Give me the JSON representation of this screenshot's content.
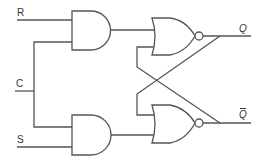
{
  "diagram": {
    "inputs": [
      {
        "id": "R",
        "label": "R"
      },
      {
        "id": "C",
        "label": "C"
      },
      {
        "id": "S",
        "label": "S"
      }
    ],
    "outputs": [
      {
        "id": "Q",
        "label": "Q"
      },
      {
        "id": "Qbar",
        "label": "Q",
        "overline": true
      }
    ],
    "gates": [
      {
        "id": "and_top",
        "type": "AND",
        "inputs": [
          "R",
          "C"
        ]
      },
      {
        "id": "and_bottom",
        "type": "AND",
        "inputs": [
          "C",
          "S"
        ]
      },
      {
        "id": "nor_top",
        "type": "NOR",
        "inputs": [
          "and_top",
          "Qbar"
        ],
        "output": "Q"
      },
      {
        "id": "nor_bottom",
        "type": "NOR",
        "inputs": [
          "Q",
          "and_bottom"
        ],
        "output": "Qbar"
      }
    ],
    "colors": {
      "stroke": "#555555",
      "text": "#333333",
      "background": "#ffffff"
    }
  }
}
